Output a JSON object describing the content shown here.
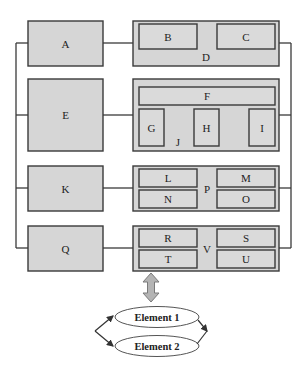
{
  "diagram": {
    "left_boxes": [
      {
        "label": "A"
      },
      {
        "label": "E"
      },
      {
        "label": "K"
      },
      {
        "label": "Q"
      }
    ],
    "groups": [
      {
        "label": "D",
        "children": [
          "B",
          "C"
        ]
      },
      {
        "label": "J",
        "children": [
          "F",
          "G",
          "H",
          "I"
        ]
      },
      {
        "label": "P",
        "children": [
          "L",
          "M",
          "N",
          "O"
        ]
      },
      {
        "label": "V",
        "children": [
          "R",
          "S",
          "T",
          "U"
        ]
      }
    ],
    "elements": [
      {
        "label": "Element 1"
      },
      {
        "label": "Element 2"
      }
    ],
    "colors": {
      "box_fill": "#d6d6d6",
      "border": "#3a3a3a",
      "arrow_fill": "#b4b4b4",
      "ellipse_fill": "#ffffff"
    }
  }
}
